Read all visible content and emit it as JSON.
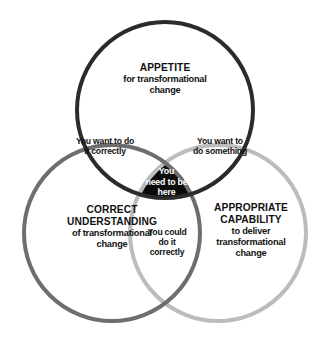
{
  "diagram": {
    "type": "venn-3-circle",
    "background_color": "#ffffff",
    "circles": [
      {
        "id": "appetite",
        "position": "top",
        "stroke_color": "#2b2b2b",
        "fill": "none",
        "stroke_width": 4,
        "cx": 165,
        "cy": 110,
        "r": 88,
        "heading": "APPETITE",
        "body_line_1": "for transformational",
        "body_line_2": "change"
      },
      {
        "id": "correct-understanding",
        "position": "bottom-left",
        "stroke_color": "#6e6e6e",
        "fill": "none",
        "stroke_width": 4,
        "cx": 112,
        "cy": 233,
        "r": 88,
        "heading_line_1": "CORRECT",
        "heading_line_2": "UNDERSTANDING",
        "body_line_1": "of transformational",
        "body_line_2": "change"
      },
      {
        "id": "appropriate-capability",
        "position": "bottom-right",
        "stroke_color": "#bcbcbc",
        "fill": "none",
        "stroke_width": 4,
        "cx": 218,
        "cy": 233,
        "r": 88,
        "heading_line_1": "APPROPRIATE",
        "heading_line_2": "CAPABILITY",
        "body_line_1": "to deliver",
        "body_line_2": "transformational",
        "body_line_3": "change"
      }
    ],
    "overlaps": [
      {
        "id": "top-left",
        "between": "appetite + correct-understanding",
        "line_1": "You want to do",
        "line_2": "it correctly"
      },
      {
        "id": "top-right",
        "between": "appetite + appropriate-capability",
        "line_1": "You want to",
        "line_2": "do something"
      },
      {
        "id": "bottom",
        "between": "correct-understanding + appropriate-capability",
        "line_1": "You could",
        "line_2": "do it",
        "line_3": "correctly"
      }
    ],
    "center": {
      "id": "triple-intersection",
      "fill_color": "#0b0b0b",
      "text_color": "#ffffff",
      "line_1": "You",
      "line_2": "need to be",
      "line_3": "here"
    }
  }
}
